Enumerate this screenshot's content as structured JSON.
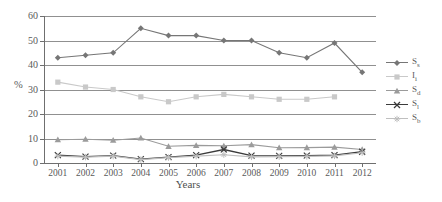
{
  "chart_data": {
    "type": "line",
    "title": "",
    "xlabel": "Years",
    "ylabel": "%",
    "ylim": [
      0,
      60
    ],
    "yticks": [
      0,
      10,
      20,
      30,
      40,
      50,
      60
    ],
    "grid": true,
    "legend_position": "right",
    "categories": [
      "2001",
      "2002",
      "2003",
      "2004",
      "2005",
      "2006",
      "2007",
      "2008",
      "2009",
      "2010",
      "2011",
      "2012"
    ],
    "series": [
      {
        "name": "Ss",
        "color": "#767676",
        "marker": "diamond",
        "values": [
          43,
          44,
          45,
          55,
          52,
          52,
          50,
          50,
          45,
          43,
          49,
          37
        ]
      },
      {
        "name": "Ii",
        "color": "#c9c9c9",
        "marker": "square",
        "values": [
          33,
          31,
          30,
          27,
          25,
          27,
          28,
          27,
          26,
          26,
          27,
          null
        ]
      },
      {
        "name": "Sd",
        "color": "#9b9b9b",
        "marker": "triangle",
        "values": [
          9.5,
          9.7,
          9.3,
          10.2,
          6.8,
          7.2,
          7.0,
          7.5,
          6.2,
          6.3,
          6.5,
          5.5
        ]
      },
      {
        "name": "Sl",
        "color": "#3b3b3b",
        "marker": "cross",
        "values": [
          3.2,
          2.6,
          3.0,
          1.6,
          2.4,
          3.2,
          5.5,
          3.0,
          2.9,
          3.0,
          3.2,
          4.6
        ]
      },
      {
        "name": "Sb",
        "color": "#bfbfbf",
        "marker": "star",
        "values": [
          2.8,
          2.4,
          2.8,
          1.4,
          2.2,
          2.8,
          3.4,
          2.5,
          2.6,
          2.7,
          2.9,
          4.2
        ]
      }
    ]
  },
  "axes": {
    "y_title": "%",
    "x_title": "Years",
    "y_tick_labels": [
      "0",
      "10",
      "20",
      "30",
      "40",
      "50",
      "60"
    ],
    "x_tick_labels": [
      "2001",
      "2002",
      "2003",
      "2004",
      "2005",
      "2006",
      "2007",
      "2008",
      "2009",
      "2010",
      "2011",
      "2012"
    ]
  },
  "legend": {
    "entries": [
      {
        "label": "Ss",
        "base": "S",
        "sub": "s"
      },
      {
        "label": "Ii",
        "base": "I",
        "sub": "i"
      },
      {
        "label": "Sd",
        "base": "S",
        "sub": "d"
      },
      {
        "label": "Sl",
        "base": "S",
        "sub": "l"
      },
      {
        "label": "Sb",
        "base": "S",
        "sub": "b"
      }
    ]
  }
}
